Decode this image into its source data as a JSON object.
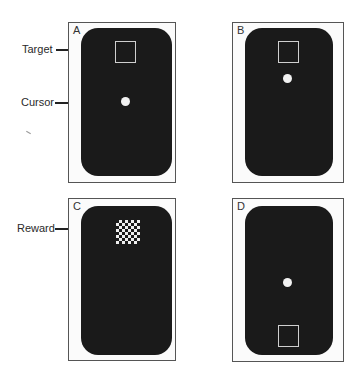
{
  "figure": {
    "panels": [
      {
        "id": "A",
        "letter": "A",
        "target_position": "top",
        "cursor_position": "center",
        "reward_visible": false
      },
      {
        "id": "B",
        "letter": "B",
        "target_position": "top",
        "cursor_position": "near-target",
        "reward_visible": false
      },
      {
        "id": "C",
        "letter": "C",
        "target_position": "none",
        "cursor_position": "none",
        "reward_visible": true
      },
      {
        "id": "D",
        "letter": "D",
        "target_position": "bottom",
        "cursor_position": "center",
        "reward_visible": false
      }
    ],
    "callouts": {
      "target": "Target",
      "cursor": "Cursor",
      "reward": "Reward"
    },
    "colors": {
      "screen": "#1a1a1a",
      "frame": "#555555",
      "target_outline": "#cfcfcf",
      "cursor": "#f2f2f2"
    }
  }
}
